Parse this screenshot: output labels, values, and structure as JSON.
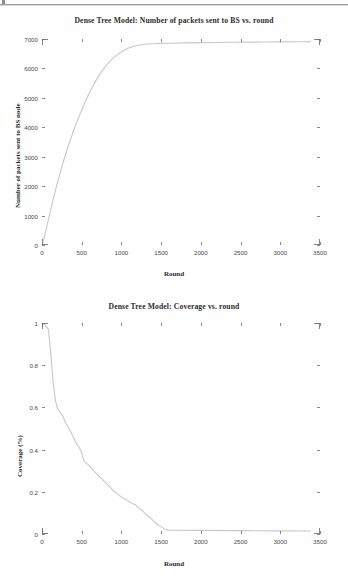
{
  "page": {
    "background": "#fefefe",
    "line_color": "#c9c9c9",
    "tick_color": "#6e6e6e",
    "text_color": "#2c2c2c"
  },
  "charts": [
    {
      "title": "Dense Tree Model: Number of packets sent to BS vs. round",
      "xlabel": "Round",
      "ylabel": "Number of packets sent to BS node",
      "xticks": [
        "0",
        "500",
        "1000",
        "1500",
        "2000",
        "2500",
        "3000",
        "3500"
      ],
      "yticks": [
        "0",
        "1000",
        "2000",
        "3000",
        "4000",
        "5000",
        "6000",
        "7000"
      ]
    },
    {
      "title": "Dense Tree Model: Coverage vs. round",
      "xlabel": "Round",
      "ylabel": "Coverage (%)",
      "xticks": [
        "0",
        "500",
        "1000",
        "1500",
        "2000",
        "2500",
        "3000",
        "3500"
      ],
      "yticks": [
        "0",
        "0.2",
        "0.4",
        "0.6",
        "0.8",
        "1"
      ]
    }
  ],
  "chart_data": [
    {
      "type": "line",
      "title": "Dense Tree Model: Number of packets sent to BS vs. round",
      "xlabel": "Round",
      "ylabel": "Number of packets sent to BS node",
      "xlim": [
        0,
        3500
      ],
      "ylim": [
        0,
        7000
      ],
      "xticks": [
        0,
        500,
        1000,
        1500,
        2000,
        2500,
        3000,
        3500
      ],
      "yticks": [
        0,
        1000,
        2000,
        3000,
        4000,
        5000,
        6000,
        7000
      ],
      "grid": false,
      "legend": null,
      "series": [
        {
          "name": "packets sent to BS",
          "x": [
            0,
            30,
            60,
            100,
            150,
            200,
            250,
            300,
            350,
            400,
            450,
            500,
            550,
            600,
            650,
            700,
            750,
            800,
            850,
            900,
            950,
            1000,
            1050,
            1100,
            1150,
            1200,
            1250,
            1300,
            1400,
            1500,
            1600,
            1800,
            2000,
            2200,
            2400,
            2600,
            2800,
            3000,
            3200,
            3380
          ],
          "y": [
            0,
            260,
            620,
            1080,
            1650,
            2180,
            2660,
            3110,
            3520,
            3900,
            4260,
            4590,
            4900,
            5190,
            5450,
            5680,
            5890,
            6070,
            6230,
            6360,
            6470,
            6560,
            6640,
            6700,
            6745,
            6780,
            6805,
            6820,
            6840,
            6850,
            6858,
            6868,
            6876,
            6882,
            6888,
            6893,
            6898,
            6903,
            6908,
            6912
          ]
        }
      ]
    },
    {
      "type": "line",
      "title": "Dense Tree Model: Coverage vs. round",
      "xlabel": "Round",
      "ylabel": "Coverage (%)",
      "xlim": [
        0,
        3500
      ],
      "ylim": [
        0,
        1
      ],
      "xticks": [
        0,
        500,
        1000,
        1500,
        2000,
        2500,
        3000,
        3500
      ],
      "yticks": [
        0,
        0.2,
        0.4,
        0.6,
        0.8,
        1
      ],
      "grid": false,
      "legend": null,
      "series": [
        {
          "name": "coverage",
          "x": [
            0,
            40,
            80,
            110,
            140,
            170,
            200,
            230,
            260,
            300,
            340,
            380,
            410,
            440,
            470,
            500,
            530,
            560,
            590,
            620,
            650,
            690,
            730,
            770,
            810,
            850,
            900,
            950,
            1000,
            1050,
            1090,
            1130,
            1170,
            1210,
            1250,
            1290,
            1330,
            1370,
            1410,
            1450,
            1500,
            1550,
            1600,
            2000,
            2500,
            3000,
            3380
          ],
          "y": [
            1.0,
            0.99,
            0.97,
            0.86,
            0.72,
            0.63,
            0.59,
            0.575,
            0.56,
            0.525,
            0.5,
            0.47,
            0.445,
            0.425,
            0.41,
            0.385,
            0.345,
            0.335,
            0.325,
            0.315,
            0.3,
            0.285,
            0.27,
            0.255,
            0.24,
            0.225,
            0.205,
            0.19,
            0.175,
            0.165,
            0.155,
            0.145,
            0.14,
            0.125,
            0.115,
            0.1,
            0.085,
            0.075,
            0.06,
            0.045,
            0.035,
            0.022,
            0.018,
            0.017,
            0.016,
            0.015,
            0.014
          ]
        }
      ]
    }
  ]
}
